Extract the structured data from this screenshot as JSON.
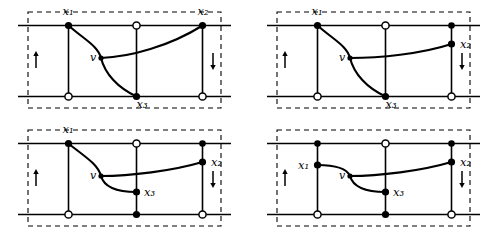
{
  "figure": {
    "type": "diagram",
    "background_color": "#ffffff",
    "stroke_color": "#000000",
    "panel_border_style": "dashed",
    "arrow_left_direction": "up",
    "arrow_right_direction": "down",
    "marker_types": [
      "filled-circle",
      "open-circle"
    ],
    "labels": {
      "x1": "x₁",
      "x2": "x₂",
      "x3": "x₃",
      "v": "v"
    },
    "panels": [
      {
        "id": "panel-top-left",
        "name": "panel-1",
        "vertices": [
          {
            "name": "x1",
            "label": "x₁",
            "marker": "filled-circle",
            "position": "top-line-left-vertical",
            "label_pos": "above-left"
          },
          {
            "name": "x2",
            "label": "x₂",
            "marker": "filled-circle",
            "position": "top-line-right-vertical",
            "label_pos": "above"
          },
          {
            "name": "x3",
            "label": "x₃",
            "marker": "filled-circle",
            "position": "bottom-line-middle-vertical",
            "label_pos": "below-right"
          },
          {
            "name": "v",
            "label": "v",
            "marker": "filled-dot",
            "position": "interior-left-of-center",
            "label_pos": "left"
          }
        ],
        "open_circles": [
          "top-middle",
          "bottom-left",
          "bottom-right"
        ],
        "arcs": [
          "x1-to-v-to-x3",
          "v-to-x2"
        ]
      },
      {
        "id": "panel-top-right",
        "name": "panel-2",
        "vertices": [
          {
            "name": "x1",
            "label": "x₁",
            "marker": "filled-circle",
            "position": "top-line-left-vertical",
            "label_pos": "above-left"
          },
          {
            "name": "x2",
            "label": "x₂",
            "marker": "filled-circle",
            "position": "right-vertical-midway",
            "label_pos": "right"
          },
          {
            "name": "x3",
            "label": "x₃",
            "marker": "filled-circle",
            "position": "bottom-line-middle-vertical",
            "label_pos": "below-right"
          },
          {
            "name": "v",
            "label": "v",
            "marker": "filled-dot",
            "position": "interior-left-of-center",
            "label_pos": "left"
          }
        ],
        "open_circles": [
          "top-middle",
          "bottom-left",
          "bottom-right"
        ],
        "filled_circles_extra": [
          "top-right"
        ],
        "arcs": [
          "x1-to-v-to-x3",
          "v-to-x2"
        ]
      },
      {
        "id": "panel-bottom-left",
        "name": "panel-3",
        "vertices": [
          {
            "name": "x1",
            "label": "x₁",
            "marker": "filled-circle",
            "position": "top-line-left-vertical",
            "label_pos": "above-left"
          },
          {
            "name": "x2",
            "label": "x₂",
            "marker": "filled-circle",
            "position": "right-vertical-midway",
            "label_pos": "right"
          },
          {
            "name": "x3",
            "label": "x₃",
            "marker": "filled-circle",
            "position": "middle-vertical-lower-interior",
            "label_pos": "right"
          },
          {
            "name": "v",
            "label": "v",
            "marker": "filled-dot",
            "position": "interior-left-of-center",
            "label_pos": "left"
          }
        ],
        "open_circles": [
          "top-middle",
          "bottom-left",
          "bottom-right"
        ],
        "filled_circles_extra": [
          "top-right",
          "bottom-middle"
        ],
        "arcs": [
          "x1-to-v-to-x3",
          "v-to-x2"
        ]
      },
      {
        "id": "panel-bottom-right",
        "name": "panel-4",
        "vertices": [
          {
            "name": "x1",
            "label": "x₁",
            "marker": "filled-circle",
            "position": "left-vertical-upper-interior",
            "label_pos": "left"
          },
          {
            "name": "x2",
            "label": "x₂",
            "marker": "filled-circle",
            "position": "right-vertical-midway",
            "label_pos": "right"
          },
          {
            "name": "x3",
            "label": "x₃",
            "marker": "filled-circle",
            "position": "middle-vertical-lower-interior",
            "label_pos": "right"
          },
          {
            "name": "v",
            "label": "v",
            "marker": "filled-dot",
            "position": "interior-left-of-center",
            "label_pos": "left"
          }
        ],
        "open_circles": [
          "top-middle",
          "bottom-left",
          "bottom-right"
        ],
        "filled_circles_extra": [
          "top-left",
          "top-right",
          "bottom-middle"
        ],
        "arcs": [
          "x1-to-v-to-x3",
          "v-to-x2"
        ]
      }
    ]
  }
}
